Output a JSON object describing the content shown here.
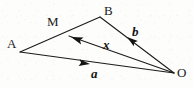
{
  "figure": {
    "type": "vector-geometry-diagram",
    "canvas": {
      "width": 193,
      "height": 88,
      "background": "#fdfdfc"
    },
    "stroke_color": "#1a1a1a",
    "stroke_width": 1.0,
    "points": [
      {
        "id": "A",
        "label": "A",
        "x": 20,
        "y": 52,
        "label_x": 7,
        "label_y": 37
      },
      {
        "id": "B",
        "label": "B",
        "x": 100,
        "y": 17,
        "label_x": 104,
        "label_y": 5
      },
      {
        "id": "O",
        "label": "O",
        "x": 174,
        "y": 73,
        "label_x": 177,
        "label_y": 66
      },
      {
        "id": "M",
        "label": "M",
        "x": 69,
        "y": 36,
        "label_x": 47,
        "label_y": 15
      }
    ],
    "segments": [
      {
        "id": "AB",
        "from": "A",
        "to": "B",
        "x1": 20,
        "y1": 52,
        "x2": 100,
        "y2": 17
      },
      {
        "id": "AO",
        "from": "A",
        "to": "O",
        "x1": 20,
        "y1": 52,
        "x2": 174,
        "y2": 73
      },
      {
        "id": "BO",
        "from": "B",
        "to": "O",
        "x1": 100,
        "y1": 17,
        "x2": 174,
        "y2": 73
      },
      {
        "id": "MO",
        "from": "M",
        "to": "O",
        "x1": 69,
        "y1": 36,
        "x2": 174,
        "y2": 73
      }
    ],
    "vectors": [
      {
        "id": "a",
        "label": "a",
        "from": "A",
        "to": "O",
        "arrow_x": 90,
        "arrow_y": 64,
        "arrow_angle": 7.8,
        "label_x": 91,
        "label_y": 67
      },
      {
        "id": "b",
        "label": "b",
        "from": "O",
        "to": "B",
        "arrow_x": 127,
        "arrow_y": 37,
        "arrow_angle": 217,
        "label_x": 132,
        "label_y": 25
      },
      {
        "id": "x",
        "label": "x",
        "from": "O",
        "to": "M",
        "arrow_x": 71,
        "arrow_y": 37,
        "arrow_angle": 199.4,
        "label_x": 103,
        "label_y": 38
      }
    ]
  }
}
